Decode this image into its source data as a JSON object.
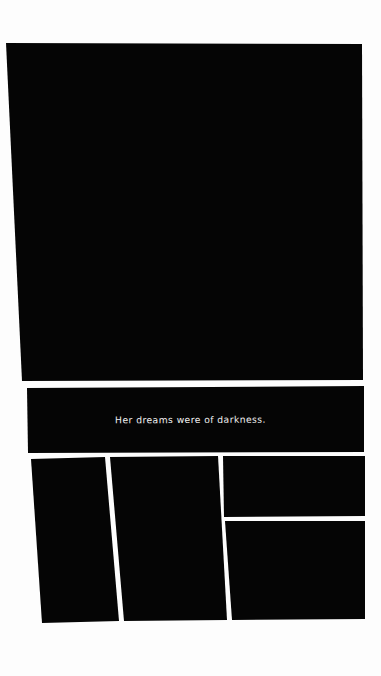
{
  "page": {
    "width": 381,
    "height": 676,
    "background_color": "#fdfdfd",
    "ink_color": "#050505",
    "caption_text_color": "#f2f2f2"
  },
  "panels": [
    {
      "id": "panel-1",
      "name": "splash-panel",
      "fill": "#050505",
      "points": "6,43 362,44 363,380 22,381",
      "caption": null
    },
    {
      "id": "panel-2",
      "name": "caption-panel",
      "fill": "#050505",
      "points": "27,388 364,386 364,452 28,453",
      "caption": "Her dreams were of darkness."
    },
    {
      "id": "panel-3",
      "name": "bottom-left-panel",
      "fill": "#050505",
      "points": "31,459 105,457 119,621 42,623",
      "caption": null
    },
    {
      "id": "panel-4",
      "name": "bottom-center-panel",
      "fill": "#050505",
      "points": "110,457 218,456 227,620 124,621",
      "caption": null
    },
    {
      "id": "panel-5",
      "name": "bottom-right-top-panel",
      "fill": "#050505",
      "points": "223,456 365,456 365,516 224,517",
      "caption": null
    },
    {
      "id": "panel-6",
      "name": "bottom-right-bottom-panel",
      "fill": "#050505",
      "points": "225,521 365,521 365,619 232,620",
      "caption": null
    }
  ],
  "captions": [
    {
      "id": "caption-1",
      "panel": "panel-2",
      "text": "Her dreams were of darkness."
    }
  ]
}
